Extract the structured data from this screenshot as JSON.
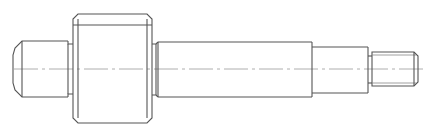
{
  "drawing": {
    "type": "technical-drawing",
    "subject": "stepped shaft side view",
    "line_color": "#555555",
    "centerline_color": "#9a9a9a",
    "background": "#ffffff",
    "sections": [
      {
        "name": "left-journal",
        "x": [
          13,
          68
        ],
        "y": [
          41,
          97
        ],
        "chamfer": true
      },
      {
        "name": "left-relief-groove",
        "x": [
          68,
          73
        ],
        "y": [
          44,
          94
        ]
      },
      {
        "name": "main-body",
        "x": [
          73,
          152
        ],
        "y": [
          14,
          123
        ],
        "chamfer": true
      },
      {
        "name": "right-relief-groove",
        "x": [
          152,
          158
        ],
        "y": [
          44,
          95
        ]
      },
      {
        "name": "main-shaft",
        "x": [
          158,
          312
        ],
        "y": [
          42,
          97
        ]
      },
      {
        "name": "step-shaft",
        "x": [
          312,
          368
        ],
        "y": [
          47,
          93
        ]
      },
      {
        "name": "thread-neck",
        "x": [
          368,
          372
        ],
        "y": [
          56,
          83
        ]
      },
      {
        "name": "threaded-end",
        "x": [
          372,
          418
        ],
        "y": [
          52,
          86
        ],
        "chamfer": true
      }
    ],
    "centerline": {
      "y": 69,
      "x": [
        14,
        425
      ]
    }
  }
}
